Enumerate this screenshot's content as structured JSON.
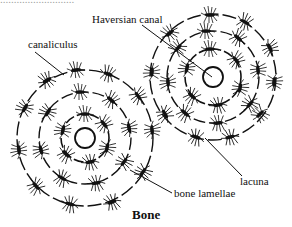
{
  "figure": {
    "caption": "Bone",
    "top_clipped_text": "...........................",
    "labels": {
      "haversian_canal": "Haversian canal",
      "canaliculus": "canaliculus",
      "lacuna": "lacuna",
      "bone_lamellae": "bone lamellae"
    },
    "osteons": [
      {
        "name": "left-osteon",
        "center": [
          85,
          138
        ],
        "canal_radius": 10,
        "lamella_radii": [
          24,
          46,
          68
        ]
      },
      {
        "name": "right-osteon",
        "center": [
          213,
          77
        ],
        "canal_radius": 10,
        "lamella_radii": [
          28,
          46,
          63
        ]
      }
    ],
    "colors": {
      "ink": "#111111",
      "background": "#ffffff"
    }
  }
}
